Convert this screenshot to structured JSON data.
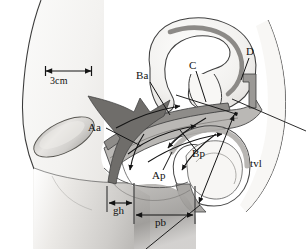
{
  "figure": {
    "type": "anatomical-line-diagram",
    "width": 306,
    "height": 249,
    "background_color": "#ffffff",
    "line_color": "#1a1a1a"
  },
  "labels": {
    "scale_bar": "3cm",
    "point_aa": "Aa",
    "point_ba": "Ba",
    "point_c": "C",
    "point_d": "D",
    "point_ap": "Ap",
    "point_bp": "Bp",
    "measure_gh": "gh",
    "measure_pb": "pb",
    "measure_tvl": "tvl"
  },
  "measurements": [
    {
      "id": "scale",
      "label": "3cm",
      "x1": 45,
      "x2": 92,
      "y": 71,
      "orientation": "horizontal"
    },
    {
      "id": "gh",
      "label": "gh",
      "x1": 107,
      "x2": 134,
      "y": 203,
      "orientation": "horizontal"
    },
    {
      "id": "pb",
      "label": "pb",
      "x1": 134,
      "x2": 195,
      "y": 215,
      "orientation": "horizontal"
    },
    {
      "id": "tvl",
      "label": "tvl",
      "x1": 234,
      "y1": 113,
      "x2": 198,
      "y2": 204,
      "orientation": "diagonal"
    }
  ],
  "landmark_points": [
    {
      "id": "Aa",
      "label": "Aa",
      "label_x": 92,
      "label_y": 128,
      "leader_to_x": 139,
      "leader_to_y": 145
    },
    {
      "id": "Ba",
      "label": "Ba",
      "label_x": 138,
      "label_y": 76,
      "leader_to_x": 166,
      "leader_to_y": 111
    },
    {
      "id": "C",
      "label": "C",
      "label_x": 192,
      "label_y": 66,
      "leader_to_x": 207,
      "leader_to_y": 101
    },
    {
      "id": "D",
      "label": "D",
      "label_x": 249,
      "label_y": 52,
      "leader_to_x": 237,
      "leader_to_y": 85
    },
    {
      "id": "Ap",
      "label": "Ap",
      "label_x": 156,
      "label_y": 176,
      "leader_to_x": 170,
      "leader_to_y": 155
    },
    {
      "id": "Bp",
      "label": "Bp",
      "label_x": 195,
      "label_y": 155,
      "leader_to_x": 178,
      "leader_to_y": 133
    }
  ],
  "colors": {
    "outline": "#2a2a2a",
    "tissue_light": "#f2f1ef",
    "tissue_mid": "#c9c7c4",
    "tissue_dark": "#8f8d8a",
    "wall_gray": "#b3b1ae",
    "bone_fill": "#d8d6d3",
    "arrow_fill": "#7d7b79"
  }
}
